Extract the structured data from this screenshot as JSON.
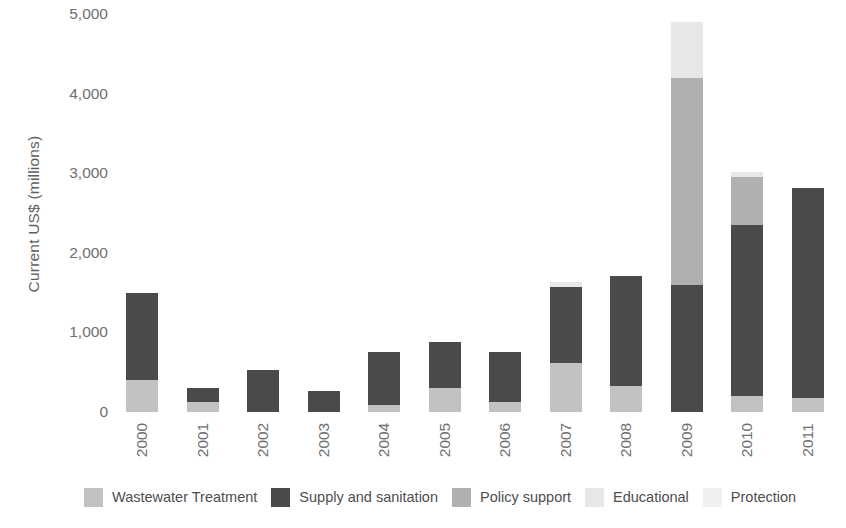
{
  "chart_data": {
    "type": "bar",
    "stacked": true,
    "title": "",
    "xlabel": "",
    "ylabel": "Current US$ (millions)",
    "ylim": [
      0,
      5000
    ],
    "ytick_labels": [
      "5,000",
      "4,000",
      "3,000",
      "2,000",
      "1,000",
      "0"
    ],
    "ytick_values": [
      5000,
      4000,
      3000,
      2000,
      1000,
      0
    ],
    "grid": false,
    "legend_position": "bottom",
    "categories": [
      "2000",
      "2001",
      "2002",
      "2003",
      "2004",
      "2005",
      "2006",
      "2007",
      "2008",
      "2009",
      "2010",
      "2011"
    ],
    "series": [
      {
        "name": "Wastewater Treatment",
        "color": "#c2c2c2",
        "values": [
          400,
          120,
          0,
          0,
          90,
          300,
          130,
          610,
          330,
          0,
          200,
          180
        ]
      },
      {
        "name": "Supply and sanitation",
        "color": "#4a4a4a",
        "values": [
          1100,
          180,
          530,
          265,
          670,
          580,
          620,
          960,
          1380,
          1600,
          2150,
          2640
        ]
      },
      {
        "name": "Policy support",
        "color": "#b0b0b0",
        "values": [
          0,
          0,
          0,
          0,
          0,
          0,
          0,
          0,
          0,
          2600,
          600,
          0
        ]
      },
      {
        "name": "Educational",
        "color": "#e8e8e8",
        "values": [
          0,
          0,
          0,
          0,
          0,
          0,
          0,
          60,
          0,
          700,
          70,
          0
        ]
      },
      {
        "name": "Protection",
        "color": "#f0f0f0",
        "values": [
          0,
          0,
          0,
          0,
          0,
          0,
          0,
          0,
          0,
          0,
          0,
          0
        ]
      }
    ],
    "totals": [
      1500,
      300,
      530,
      265,
      760,
      880,
      750,
      1630,
      1710,
      4900,
      3020,
      2820
    ]
  },
  "legend": {
    "items": [
      {
        "label": "Wastewater Treatment",
        "color": "#c2c2c2"
      },
      {
        "label": "Supply and sanitation",
        "color": "#4a4a4a"
      },
      {
        "label": "Policy support",
        "color": "#b0b0b0"
      },
      {
        "label": "Educational",
        "color": "#e8e8e8"
      },
      {
        "label": "Protection",
        "color": "#f0f0f0"
      }
    ]
  }
}
